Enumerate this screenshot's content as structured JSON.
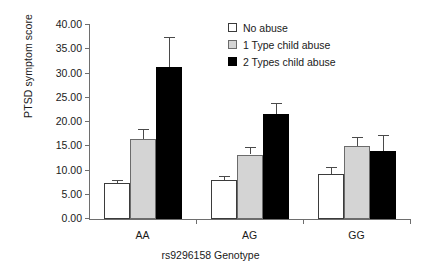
{
  "chart_data": {
    "type": "bar",
    "title": "",
    "xlabel": "rs9296158 Genotype",
    "ylabel": "PTSD symptom score",
    "categories": [
      "AA",
      "AG",
      "GG"
    ],
    "ylim": [
      0,
      40
    ],
    "ytick_step": 5,
    "ytick_labels": [
      "0.00",
      "5.00",
      "10.00",
      "15.00",
      "20.00",
      "25.00",
      "30.00",
      "35.00",
      "40.00"
    ],
    "ytick_values": [
      0,
      5,
      10,
      15,
      20,
      25,
      30,
      35,
      40
    ],
    "grid": false,
    "legend_position": "top-right",
    "error_bar_type": "standard error",
    "series": [
      {
        "name": "No abuse",
        "swatch": "sw-none",
        "color": "#ffffff",
        "values": [
          7.4,
          8.0,
          9.2
        ],
        "errors": [
          0.7,
          0.9,
          1.5
        ]
      },
      {
        "name": "1 Type child abuse",
        "swatch": "sw-one",
        "color": "#d4d4d4",
        "values": [
          16.5,
          13.3,
          15.0
        ],
        "errors": [
          2.0,
          1.6,
          2.0
        ]
      },
      {
        "name": "2 Types child abuse",
        "swatch": "sw-two",
        "color": "#000000",
        "values": [
          31.3,
          21.6,
          14.0
        ],
        "errors": [
          6.2,
          2.3,
          3.3
        ]
      }
    ]
  }
}
